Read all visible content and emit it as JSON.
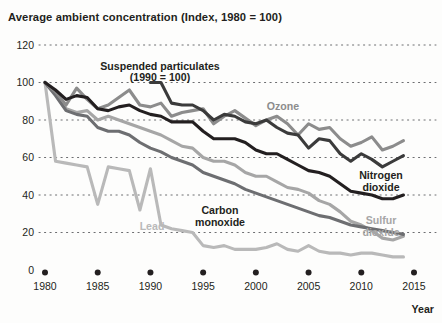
{
  "chart_data": {
    "type": "line",
    "title": "Average ambient concentration (Index, 1980 = 100)",
    "xlabel": "Year",
    "ylabel": "",
    "xlim": [
      1980,
      2015
    ],
    "ylim": [
      0,
      120
    ],
    "yticks": [
      "0",
      "20",
      "40",
      "60",
      "80",
      "100",
      "120"
    ],
    "xticks": [
      "1980",
      "1985",
      "1990",
      "1995",
      "2000",
      "2005",
      "2010",
      "2015"
    ],
    "grid": true,
    "legend_position": "inline-annotations",
    "x": [
      1980,
      1981,
      1982,
      1983,
      1984,
      1985,
      1986,
      1987,
      1988,
      1989,
      1990,
      1991,
      1992,
      1993,
      1994,
      1995,
      1996,
      1997,
      1998,
      1999,
      2000,
      2001,
      2002,
      2003,
      2004,
      2005,
      2006,
      2007,
      2008,
      2009,
      2010,
      2011,
      2012,
      2013,
      2014
    ],
    "series": [
      {
        "name": "Ozone",
        "color": "#8c8c8c",
        "label": "Ozone",
        "note": "",
        "values": [
          100,
          95,
          88,
          97,
          91,
          86,
          88,
          92,
          96,
          88,
          87,
          89,
          82,
          84,
          85,
          86,
          78,
          82,
          85,
          81,
          77,
          80,
          82,
          78,
          72,
          78,
          75,
          76,
          70,
          66,
          68,
          71,
          64,
          66,
          69
        ]
      },
      {
        "name": "Suspended particulates",
        "color": "#3b3b3b",
        "label": "Suspended particulates",
        "note": "(1990 = 100)",
        "base_year": 1990,
        "values": [
          null,
          null,
          null,
          null,
          null,
          null,
          null,
          null,
          null,
          null,
          100,
          100,
          89,
          88,
          88,
          85,
          80,
          83,
          82,
          79,
          78,
          80,
          76,
          73,
          72,
          65,
          70,
          69,
          62,
          58,
          62,
          59,
          55,
          58,
          61
        ]
      },
      {
        "name": "Nitrogen dioxide",
        "color": "#231f20",
        "label": "Nitrogen dioxide",
        "note": "",
        "values": [
          100,
          96,
          91,
          93,
          92,
          86,
          85,
          87,
          88,
          85,
          83,
          82,
          79,
          79,
          79,
          74,
          70,
          70,
          70,
          68,
          64,
          62,
          62,
          59,
          56,
          53,
          52,
          50,
          46,
          42,
          41,
          40,
          38,
          38,
          40
        ]
      },
      {
        "name": "Sulfur dioxide",
        "color": "#a6a6a6",
        "label": "Sulfur dioxide",
        "note": "",
        "values": [
          100,
          94,
          86,
          84,
          85,
          80,
          82,
          80,
          78,
          76,
          74,
          72,
          69,
          66,
          65,
          60,
          58,
          58,
          56,
          52,
          50,
          50,
          47,
          44,
          43,
          41,
          37,
          35,
          31,
          26,
          24,
          21,
          17,
          16,
          18
        ]
      },
      {
        "name": "Carbon monoxide",
        "color": "#6d6e71",
        "label": "Carbon monoxide",
        "note": "",
        "values": [
          100,
          93,
          85,
          83,
          82,
          76,
          74,
          74,
          72,
          68,
          65,
          63,
          60,
          58,
          56,
          52,
          50,
          48,
          46,
          43,
          41,
          39,
          37,
          35,
          33,
          31,
          29,
          28,
          26,
          24,
          23,
          22,
          21,
          20,
          19
        ]
      },
      {
        "name": "Lead",
        "color": "#b9b9b9",
        "label": "Lead",
        "note": "",
        "values": [
          100,
          58,
          57,
          56,
          55,
          35,
          55,
          54,
          53,
          32,
          54,
          24,
          22,
          21,
          20,
          13,
          12,
          13,
          11,
          11,
          11,
          12,
          14,
          11,
          10,
          13,
          10,
          9,
          9,
          8,
          9,
          9,
          8,
          7,
          7
        ]
      }
    ],
    "annotations": [
      {
        "text": "Suspended particulates",
        "x": 160,
        "y": 70
      },
      {
        "text": "(1990 = 100)",
        "x": 160,
        "y": 81
      },
      {
        "text": "Ozone",
        "x": 283,
        "y": 110
      },
      {
        "text": "Nitrogen",
        "x": 381,
        "y": 179
      },
      {
        "text": "dioxide",
        "x": 381,
        "y": 191
      },
      {
        "text": "Sulfur",
        "x": 381,
        "y": 224
      },
      {
        "text": "dioxide",
        "x": 381,
        "y": 236
      },
      {
        "text": "Carbon",
        "x": 220,
        "y": 214
      },
      {
        "text": "monoxide",
        "x": 220,
        "y": 226
      },
      {
        "text": "Lead",
        "x": 152,
        "y": 230
      }
    ]
  },
  "axes": {
    "year_label": "Year"
  }
}
